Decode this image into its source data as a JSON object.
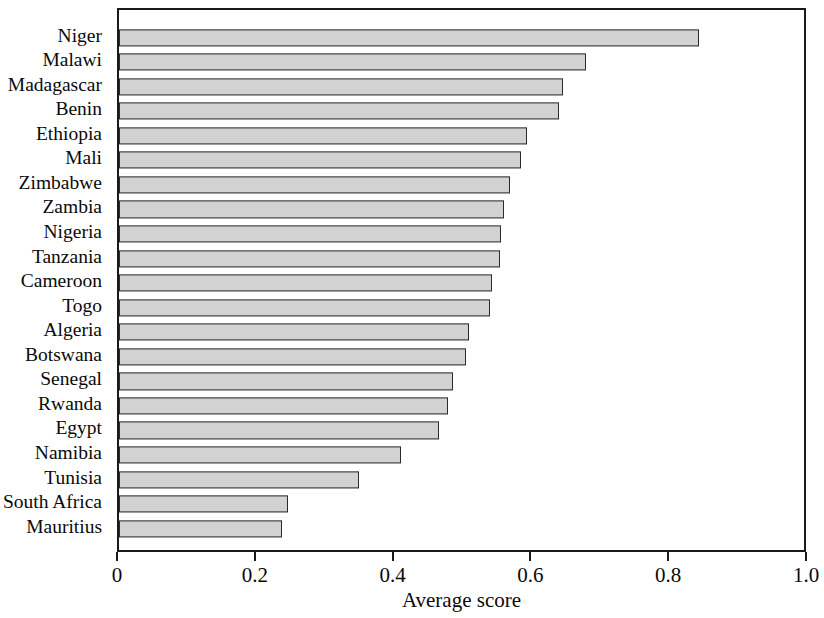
{
  "chart_data": {
    "type": "bar",
    "orientation": "horizontal",
    "title": "",
    "subtitle": "",
    "xlabel": "Average score",
    "ylabel": "",
    "xlim": [
      0,
      1.0
    ],
    "xticks": [
      "0",
      "0.2",
      "0.4",
      "0.6",
      "0.8",
      "1.0"
    ],
    "xtick_values": [
      0,
      0.2,
      0.4,
      0.6,
      0.8,
      1.0
    ],
    "grid": false,
    "legend": null,
    "bar_fill_color": "#d2d2d2",
    "bar_edge_color": "#2a2a2a",
    "axis_color": "#1a1a1a",
    "categories": [
      "Niger",
      "Malawi",
      "Madagascar",
      "Benin",
      "Ethiopia",
      "Mali",
      "Zimbabwe",
      "Zambia",
      "Nigeria",
      "Tanzania",
      "Cameroon",
      "Togo",
      "Algeria",
      "Botswana",
      "Senegal",
      "Rwanda",
      "Egypt",
      "Namibia",
      "Tunisia",
      "South Africa",
      "Mauritius"
    ],
    "values": [
      0.842,
      0.678,
      0.645,
      0.638,
      0.592,
      0.584,
      0.568,
      0.559,
      0.555,
      0.553,
      0.541,
      0.538,
      0.508,
      0.503,
      0.485,
      0.477,
      0.465,
      0.409,
      0.348,
      0.246,
      0.236
    ]
  }
}
